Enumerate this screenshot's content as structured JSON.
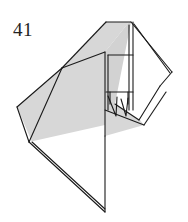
{
  "diagram": {
    "kind": "origami-fold-step",
    "step_number": "41",
    "background_color": "#ffffff",
    "line_color": "#1a1a1a",
    "paper_front_color": "#d7d7d7",
    "paper_back_color": "#ffffff",
    "shade_color_dark": "#c9c9c9"
  },
  "shapes": {
    "large_left_panel": {
      "name": "large-left-shaded-panel",
      "fill": "#d7d7d7",
      "points": "62,68 17,107 29,142 105,125 105,52"
    },
    "upper_shaded_panel": {
      "name": "upper-shaded-panel",
      "fill": "#d7d7d7",
      "points": "106,22 62,68 105,52 129,22"
    },
    "upper_right_column": {
      "name": "upper-right-shaded-column",
      "fill": "#d2d2d2",
      "points": "105,52 129,22 133,22 133,110 105,110"
    },
    "mid_shaded_wedge": {
      "name": "mid-shaded-wedge",
      "fill": "#d7d7d7",
      "points": "105,110 133,110 144,125 105,136"
    },
    "right_white_flap": {
      "name": "right-white-flap",
      "fill": "#ffffff",
      "points": "131,22 172,72 160,86 145,78 139,120 115,104"
    },
    "right_lower_white_panel": {
      "name": "right-lower-white-panel",
      "fill": "#ffffff",
      "points": "160,86 166,92 144,125 133,110"
    },
    "bottom_white_point": {
      "name": "bottom-white-point",
      "fill": "#ffffff",
      "points": "29,142 105,136 105,212"
    },
    "lower_left_white_sliver": {
      "name": "lower-left-white-sliver",
      "fill": "#ffffff",
      "points": "17,107 29,142 32,142"
    }
  },
  "creases": {
    "items": [
      {
        "name": "crease-left-vertex-to-bottom-left",
        "d": "M62,68 L29,142"
      },
      {
        "name": "crease-left-vertex-to-top",
        "d": "M62,68 L106,22"
      },
      {
        "name": "crease-left-vertex-to-mid-right",
        "d": "M62,68 L105,52"
      },
      {
        "name": "crease-panel-right-edge",
        "d": "M105,52 L105,136"
      },
      {
        "name": "crease-inner-vertical-left",
        "d": "M108,55 L108,110"
      },
      {
        "name": "crease-inner-vertical-right",
        "d": "M129,25 L129,110"
      },
      {
        "name": "crease-inner-horizontal-upper",
        "d": "M108,55 L133,55"
      },
      {
        "name": "crease-inner-horizontal-lower",
        "d": "M106,92 L133,92"
      },
      {
        "name": "crease-small-tick-left",
        "d": "M110,92 L110,104"
      },
      {
        "name": "crease-small-tick-right",
        "d": "M128,92 L128,104"
      },
      {
        "name": "crease-small-vee-left",
        "d": "M108,96 L116,116 L117,97"
      },
      {
        "name": "crease-small-vee-right",
        "d": "M121,99 L126,116 L128,98"
      },
      {
        "name": "crease-diagonal-to-flap",
        "d": "M105,110 L144,125"
      },
      {
        "name": "crease-right-spine-outer",
        "d": "M131,22 L172,72"
      },
      {
        "name": "crease-right-spine-inner",
        "d": "M134,24 L170,73"
      },
      {
        "name": "crease-flap-fold-lower",
        "d": "M172,72 L160,86"
      },
      {
        "name": "crease-flap-inner-edge",
        "d": "M160,86 L139,120"
      },
      {
        "name": "crease-flap-bottom",
        "d": "M139,120 L115,104"
      },
      {
        "name": "crease-flap-bottom-outer",
        "d": "M166,92 L144,125"
      },
      {
        "name": "crease-bottom-point-left",
        "d": "M29,142 L105,212"
      },
      {
        "name": "crease-bottom-point-left-inner",
        "d": "M32,142 L105,209"
      },
      {
        "name": "crease-bottom-point-right",
        "d": "M105,136 L105,212"
      },
      {
        "name": "crease-outline-left-upper",
        "d": "M62,68 L17,107"
      },
      {
        "name": "crease-outline-left-lower",
        "d": "M17,107 L29,142"
      },
      {
        "name": "crease-top-edge",
        "d": "M106,22 L131,22"
      },
      {
        "name": "crease-shelf-right",
        "d": "M133,22 L133,110"
      }
    ]
  }
}
